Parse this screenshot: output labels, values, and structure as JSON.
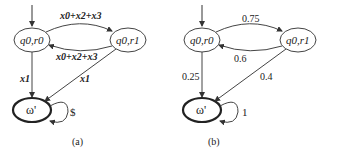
{
  "diagrams": [
    {
      "caption": "(a)",
      "states": {
        "s0": "q0,r0",
        "s1": "q0,r1",
        "final": "ω'"
      },
      "edges": {
        "s0_to_s1": "x0+x2+x3",
        "s1_to_s0": "x0+x2+x3",
        "s0_to_final": "x1",
        "s1_to_final": "x1",
        "final_loop": "$"
      }
    },
    {
      "caption": "(b)",
      "states": {
        "s0": "q0,r0",
        "s1": "q0,r1",
        "final": "ω'"
      },
      "edges": {
        "s0_to_s1": "0.75",
        "s1_to_s0": "0.6",
        "s0_to_final": "0.25",
        "s1_to_final": "0.4",
        "final_loop": "1"
      }
    }
  ]
}
